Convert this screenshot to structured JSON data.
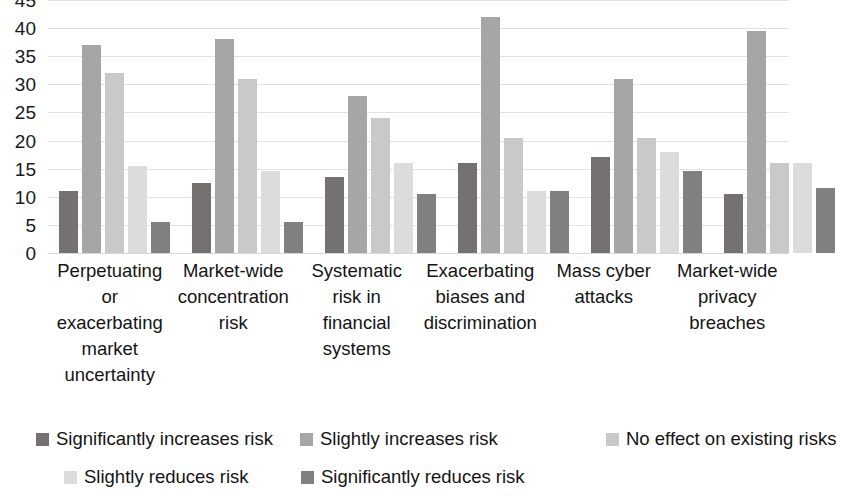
{
  "chart_data": {
    "type": "bar",
    "title": "",
    "subtitle": "",
    "xlabel": "",
    "ylabel": "",
    "ylim": [
      0,
      45
    ],
    "yticks": [
      45,
      40,
      35,
      30,
      25,
      20,
      15,
      10,
      5,
      0
    ],
    "grid": true,
    "legend_position": "bottom",
    "categories": [
      "Perpetuating or exacerbating market uncertainty",
      "Market-wide concentration risk",
      "Systematic risk in financial systems",
      "Exacerbating biases and discrimination",
      "Mass cyber attacks",
      "Market-wide privacy breaches"
    ],
    "category_lines": [
      [
        "Perpetuating",
        "or",
        "exacerbating",
        "market",
        "uncertainty"
      ],
      [
        "Market-wide",
        "concentration",
        "risk"
      ],
      [
        "Systematic",
        "risk in",
        "financial",
        "systems"
      ],
      [
        "Exacerbating",
        "biases and",
        "discrimination"
      ],
      [
        "Mass cyber",
        "attacks"
      ],
      [
        "Market-wide",
        "privacy",
        "breaches"
      ]
    ],
    "series": [
      {
        "name": "Significantly increases risk",
        "color": "#767171",
        "values": [
          11,
          12.5,
          13.5,
          16,
          17,
          10.5
        ]
      },
      {
        "name": "Slightly increases risk",
        "color": "#A6A6A6",
        "values": [
          37,
          38,
          28,
          42,
          31,
          39.5
        ]
      },
      {
        "name": "No effect on existing risks",
        "color": "#C9C9C9",
        "values": [
          32,
          31,
          24,
          20.5,
          20.5,
          16
        ]
      },
      {
        "name": "Slightly reduces risk",
        "color": "#DCDCDC",
        "values": [
          15.5,
          14.5,
          16,
          11,
          18,
          16
        ]
      },
      {
        "name": "Significantly reduces risk",
        "color": "#808080",
        "values": [
          5.5,
          5.5,
          10.5,
          11,
          14.5,
          11.5
        ]
      }
    ]
  }
}
